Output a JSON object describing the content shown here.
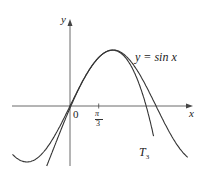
{
  "chart_data": {
    "type": "line",
    "title": "",
    "xlabel": "x",
    "ylabel": "y",
    "series": [
      {
        "name": "y = sin x",
        "function": "sin(x)",
        "x_range": [
          -2.1,
          4.3
        ]
      },
      {
        "name": "T3",
        "function": "third-degree Taylor polynomial of sin x centered at pi/3",
        "center": 1.0472,
        "x_range": [
          -0.85,
          3.05
        ]
      }
    ],
    "tick_labels": {
      "x": [
        "0",
        "π/3"
      ]
    },
    "annotations": [
      "y = sin x",
      "T3"
    ],
    "xlim": [
      -2.1,
      4.4
    ],
    "ylim": [
      -1.1,
      1.55
    ],
    "grid": false
  },
  "labels": {
    "y_axis": "y",
    "x_axis": "x",
    "origin": "0",
    "pi_num": "π",
    "pi_den": "3",
    "sin_label": "y = sin x",
    "t3_main": "T",
    "t3_sub": "3"
  },
  "colors": {
    "curve": "#333333",
    "axis": "#444444"
  }
}
